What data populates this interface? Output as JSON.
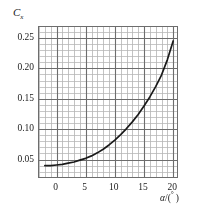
{
  "chart_data": {
    "type": "line",
    "title": "",
    "subtitle": "",
    "ylabel": "C",
    "ylabel_subscript": "x",
    "xlabel": "α/(°)",
    "xlabel_symbol": "α",
    "xlabel_unit": "°",
    "xlim": [
      -3,
      21
    ],
    "ylim": [
      0.018,
      0.268
    ],
    "xticks": [
      0,
      5,
      10,
      15,
      20
    ],
    "xtick_labels": [
      "0",
      "5",
      "10",
      "15",
      "20"
    ],
    "yticks": [
      0.05,
      0.1,
      0.15,
      0.2,
      0.25
    ],
    "ytick_labels": [
      "0.05",
      "0.10",
      "0.15",
      "0.20",
      "0.25"
    ],
    "grid": true,
    "grid_minor_step_x": 1,
    "grid_minor_step_y": 0.01,
    "grid_major_step_x": 5,
    "grid_major_step_y": 0.05,
    "legend": null,
    "legend_position": "none",
    "series": [
      {
        "name": "Cx",
        "color": "#1a1a1a",
        "x": [
          -2,
          -1,
          0,
          1,
          2,
          3,
          4,
          5,
          6,
          7,
          8,
          9,
          10,
          11,
          12,
          13,
          14,
          15,
          16,
          17,
          18,
          19,
          20
        ],
        "y": [
          0.04,
          0.04,
          0.041,
          0.042,
          0.044,
          0.046,
          0.049,
          0.052,
          0.056,
          0.061,
          0.067,
          0.074,
          0.082,
          0.091,
          0.101,
          0.112,
          0.124,
          0.138,
          0.153,
          0.17,
          0.189,
          0.214,
          0.245
        ]
      }
    ],
    "colors": {
      "curve": "#1a1a1a",
      "grid_minor": "#b4b4b4",
      "grid_major": "#6d6d6d",
      "frame": "#6d6d6d",
      "text": "#1a1a1a",
      "background": "#ffffff"
    }
  }
}
